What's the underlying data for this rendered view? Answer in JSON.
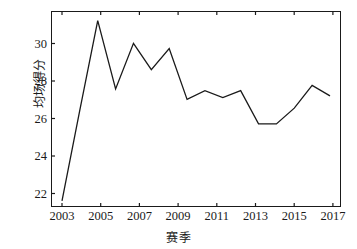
{
  "chart_data": {
    "type": "line",
    "title": "",
    "subtitle": "",
    "xlabel": "赛季",
    "ylabel": "均场得分",
    "x": [
      2003,
      2004,
      2005,
      2006,
      2007,
      2008,
      2009,
      2010,
      2011,
      2012,
      2013,
      2014,
      2015,
      2016,
      2017,
      2018
    ],
    "values": [
      21.0,
      26.2,
      31.3,
      27.4,
      30.0,
      28.5,
      29.7,
      26.8,
      27.3,
      26.9,
      27.3,
      25.4,
      25.4,
      26.3,
      27.6,
      27.0
    ],
    "series": [
      {
        "name": "均场得分",
        "values": [
          21.0,
          26.2,
          31.3,
          27.4,
          30.0,
          28.5,
          29.7,
          26.8,
          27.3,
          26.9,
          27.3,
          25.4,
          25.4,
          26.3,
          27.6,
          27.0
        ]
      }
    ],
    "xlim": [
      2003,
      2018
    ],
    "ylim": [
      20.65,
      31.85
    ],
    "xticks": [
      2003,
      2005,
      2007,
      2009,
      2011,
      2013,
      2015,
      2017
    ],
    "xtick_labels": [
      "2003",
      "2005",
      "2007",
      "2009",
      "2011",
      "2013",
      "2015",
      "2017"
    ],
    "yticks": [
      22,
      24,
      26,
      28,
      30
    ],
    "ytick_labels": [
      "22",
      "24",
      "26",
      "28",
      "30"
    ],
    "grid": false,
    "legend": false,
    "legend_position": "none",
    "line_color": "#1a1a1a",
    "line_width": 1.3,
    "markers": false,
    "annotations": []
  }
}
